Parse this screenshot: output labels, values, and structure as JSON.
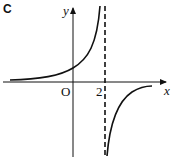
{
  "figure": {
    "tag": "C",
    "axes": {
      "x_label": "x",
      "y_label": "y",
      "origin_label": "O"
    },
    "tick_labels": [
      "2"
    ],
    "asymptote": {
      "x": 2,
      "style": "dashed",
      "label": "2"
    },
    "colors": {
      "curve": "#111111",
      "axes": "#111111"
    }
  }
}
